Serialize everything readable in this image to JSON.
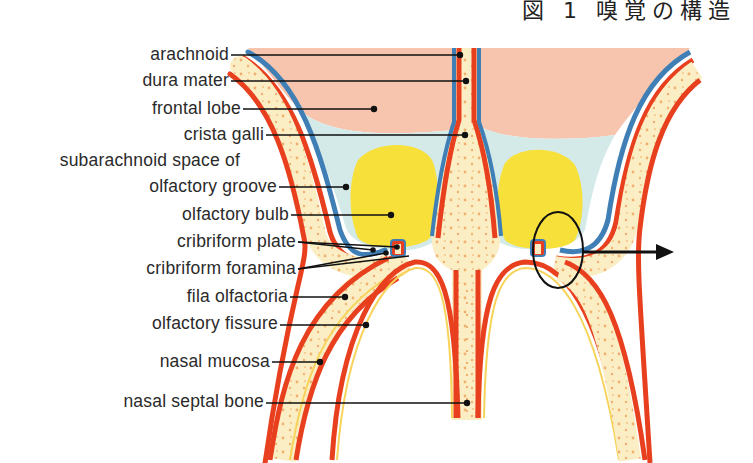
{
  "heading": "図 1  嗅覚の構造",
  "figure": {
    "labels": [
      {
        "id": "arachnoid",
        "text": "arachnoid",
        "right": 229,
        "y": 56
      },
      {
        "id": "dura-mater",
        "text": "dura mater",
        "right": 229,
        "y": 82
      },
      {
        "id": "frontal-lobe",
        "text": "frontal lobe",
        "right": 241,
        "y": 110
      },
      {
        "id": "crista-galli",
        "text": "crista galli",
        "right": 264,
        "y": 136
      },
      {
        "id": "subarachnoid-space-1",
        "text": "subarachnoid space of",
        "right": 240,
        "y": 162
      },
      {
        "id": "subarachnoid-space-2",
        "text": "olfactory groove",
        "right": 277,
        "y": 188
      },
      {
        "id": "olfactory-bulb",
        "text": "olfactory bulb",
        "right": 289,
        "y": 216
      },
      {
        "id": "cribriform-plate",
        "text": "cribriform plate",
        "right": 296,
        "y": 243
      },
      {
        "id": "cribriform-foramina",
        "text": "cribriform foramina",
        "right": 296,
        "y": 270
      },
      {
        "id": "fila-olfactoria",
        "text": "fila olfactoria",
        "right": 288,
        "y": 298
      },
      {
        "id": "olfactory-fissure",
        "text": "olfactory fissure",
        "right": 278,
        "y": 325
      },
      {
        "id": "nasal-mucosa",
        "text": "nasal mucosa",
        "right": 270,
        "y": 363
      },
      {
        "id": "nasal-septal-bone",
        "text": "nasal septal bone",
        "right": 264,
        "y": 402
      }
    ],
    "colors": {
      "brain": "#f7c4ae",
      "csf": "#d4eae9",
      "arachnoid": "#3f7fb5",
      "dura": "#e8401f",
      "bone": "#fbeec4",
      "bone_dots": "#f0b070",
      "bulb": "#f8e03a",
      "leader": "#111111"
    }
  }
}
